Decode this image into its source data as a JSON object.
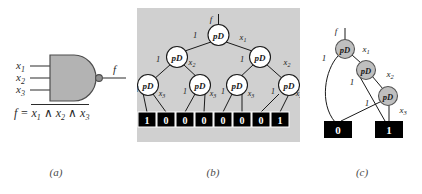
{
  "figure": {
    "captions": {
      "a": "(a)",
      "b": "(b)",
      "c": "(c)"
    }
  },
  "panel_a": {
    "name": "nand-gate-circuit",
    "inputs": [
      {
        "label": "x",
        "sub": "1"
      },
      {
        "label": "x",
        "sub": "2"
      },
      {
        "label": "x",
        "sub": "3"
      }
    ],
    "output": {
      "label": "f"
    },
    "gate_type": "NAND",
    "formula": {
      "lhs": "f =",
      "overbar_expr": "x1 ∧ x2 ∧ x3",
      "terms": [
        {
          "label": "x",
          "sub": "1"
        },
        {
          "label": "x",
          "sub": "2"
        },
        {
          "label": "x",
          "sub": "3"
        }
      ],
      "operator": "∧"
    },
    "colors": {
      "gate_fill": "#b3b3b3",
      "gate_stroke": "#4d4d4d",
      "wire": "#4d4d4d"
    }
  },
  "panel_b": {
    "name": "full-binary-decision-tree",
    "background": "#d0d0d0",
    "root_input_label": "f",
    "node_text": "pD",
    "node_fill": "#ffffff",
    "levels": [
      {
        "variable": "x1",
        "low_label": "1",
        "high_label": "x",
        "high_sub": "1",
        "nodes": 1
      },
      {
        "variable": "x2",
        "low_label": "1",
        "high_label": "x",
        "high_sub": "2",
        "nodes": 2
      },
      {
        "variable": "x3",
        "low_label": "1",
        "high_label": "x",
        "high_sub": "3",
        "nodes": 4
      }
    ],
    "terminals": [
      "1",
      "0",
      "0",
      "0",
      "0",
      "0",
      "0",
      "1"
    ],
    "terminal_fill": "#000000",
    "terminal_text_color": "#ffffff"
  },
  "panel_c": {
    "name": "reduced-binary-decision-diagram",
    "root_input_label": "f",
    "node_text": "pD",
    "node_fill": "#bfbfbf",
    "nodes": [
      {
        "variable": "x1",
        "low_label": "1",
        "high_label": "x",
        "high_sub": "1"
      },
      {
        "variable": "x2",
        "low_label": "1",
        "high_label": "x",
        "high_sub": "2"
      },
      {
        "variable": "x3",
        "low_label": "1",
        "high_label": "x",
        "high_sub": "3"
      }
    ],
    "terminals": [
      "0",
      "1"
    ],
    "terminal_fill": "#000000",
    "terminal_text_color": "#ffffff"
  }
}
